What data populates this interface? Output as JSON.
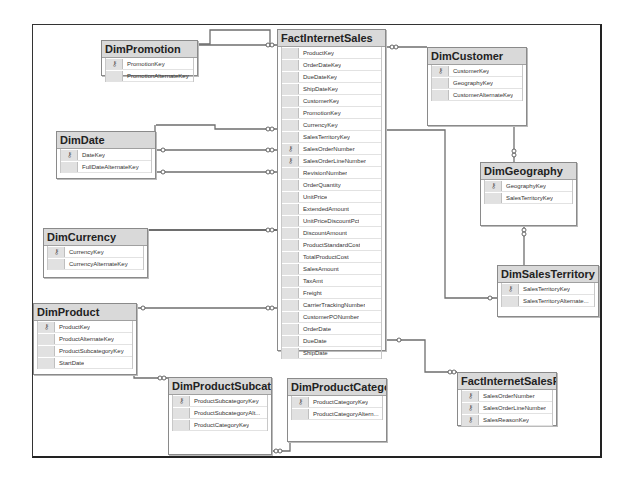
{
  "diagram": {
    "tables": [
      {
        "id": "fact_internet_sales",
        "title": "FactInternetSales",
        "x": 277,
        "y": 29,
        "w": 109,
        "h": 322,
        "columns": [
          {
            "name": "ProductKey",
            "pk": false
          },
          {
            "name": "OrderDateKey",
            "pk": false
          },
          {
            "name": "DueDateKey",
            "pk": false
          },
          {
            "name": "ShipDateKey",
            "pk": false
          },
          {
            "name": "CustomerKey",
            "pk": false
          },
          {
            "name": "PromotionKey",
            "pk": false
          },
          {
            "name": "CurrencyKey",
            "pk": false
          },
          {
            "name": "SalesTerritoryKey",
            "pk": false
          },
          {
            "name": "SalesOrderNumber",
            "pk": true
          },
          {
            "name": "SalesOrderLineNumber",
            "pk": true
          },
          {
            "name": "RevisionNumber",
            "pk": false
          },
          {
            "name": "OrderQuantity",
            "pk": false
          },
          {
            "name": "UnitPrice",
            "pk": false
          },
          {
            "name": "ExtendedAmount",
            "pk": false
          },
          {
            "name": "UnitPriceDiscountPct",
            "pk": false
          },
          {
            "name": "DiscountAmount",
            "pk": false
          },
          {
            "name": "ProductStandardCost",
            "pk": false
          },
          {
            "name": "TotalProductCost",
            "pk": false
          },
          {
            "name": "SalesAmount",
            "pk": false
          },
          {
            "name": "TaxAmt",
            "pk": false
          },
          {
            "name": "Freight",
            "pk": false
          },
          {
            "name": "CarrierTrackingNumber",
            "pk": false
          },
          {
            "name": "CustomerPONumber",
            "pk": false
          },
          {
            "name": "OrderDate",
            "pk": false
          },
          {
            "name": "DueDate",
            "pk": false
          },
          {
            "name": "ShipDate",
            "pk": false
          }
        ]
      },
      {
        "id": "dim_promotion",
        "title": "DimPromotion",
        "x": 101,
        "y": 40,
        "w": 97,
        "h": 36,
        "columns": [
          {
            "name": "PromotionKey",
            "pk": true
          },
          {
            "name": "PromotionAlternateKey",
            "pk": false
          }
        ]
      },
      {
        "id": "dim_customer",
        "title": "DimCustomer",
        "x": 427,
        "y": 47,
        "w": 100,
        "h": 79,
        "columns": [
          {
            "name": "CustomerKey",
            "pk": true
          },
          {
            "name": "GeographyKey",
            "pk": false
          },
          {
            "name": "CustomerAlternateKey",
            "pk": false
          }
        ]
      },
      {
        "id": "dim_date",
        "title": "DimDate",
        "x": 56,
        "y": 131,
        "w": 100,
        "h": 48,
        "columns": [
          {
            "name": "DateKey",
            "pk": true
          },
          {
            "name": "FullDateAlternateKey",
            "pk": false
          }
        ]
      },
      {
        "id": "dim_geography",
        "title": "DimGeography",
        "x": 480,
        "y": 162,
        "w": 97,
        "h": 64,
        "columns": [
          {
            "name": "GeographyKey",
            "pk": true
          },
          {
            "name": "SalesTerritoryKey",
            "pk": false
          }
        ]
      },
      {
        "id": "dim_currency",
        "title": "DimCurrency",
        "x": 43,
        "y": 228,
        "w": 105,
        "h": 50,
        "columns": [
          {
            "name": "CurrencyKey",
            "pk": true
          },
          {
            "name": "CurrencyAlternateKey",
            "pk": false
          }
        ]
      },
      {
        "id": "dim_sales_territory",
        "title": "DimSalesTerritory",
        "x": 497,
        "y": 265,
        "w": 102,
        "h": 52,
        "columns": [
          {
            "name": "SalesTerritoryKey",
            "pk": true
          },
          {
            "name": "SalesTerritoryAlternate...",
            "pk": false
          }
        ]
      },
      {
        "id": "dim_product",
        "title": "DimProduct",
        "x": 33,
        "y": 303,
        "w": 104,
        "h": 72,
        "columns": [
          {
            "name": "ProductKey",
            "pk": true
          },
          {
            "name": "ProductAlternateKey",
            "pk": false
          },
          {
            "name": "ProductSubcategoryKey",
            "pk": false
          },
          {
            "name": "StartDate",
            "pk": false
          }
        ]
      },
      {
        "id": "dim_product_subcategory",
        "title": "DimProductSubcatego",
        "x": 168,
        "y": 377,
        "w": 104,
        "h": 78,
        "columns": [
          {
            "name": "ProductSubcategoryKey",
            "pk": true
          },
          {
            "name": "ProductSubcategoryAlt...",
            "pk": false
          },
          {
            "name": "ProductCategoryKey",
            "pk": false
          }
        ]
      },
      {
        "id": "dim_product_category",
        "title": "DimProductCategory",
        "x": 287,
        "y": 378,
        "w": 100,
        "h": 64,
        "columns": [
          {
            "name": "ProductCategoryKey",
            "pk": true
          },
          {
            "name": "ProductCategoryAltern...",
            "pk": false
          }
        ]
      },
      {
        "id": "fact_internet_sales_reason",
        "title": "FactInternetSalesRea",
        "x": 457,
        "y": 372,
        "w": 100,
        "h": 54,
        "columns": [
          {
            "name": "SalesOrderNumber",
            "pk": true
          },
          {
            "name": "SalesOrderLineNumber",
            "pk": true
          },
          {
            "name": "SalesReasonKey",
            "pk": true
          }
        ]
      }
    ],
    "relationships": [
      {
        "from": "dim_promotion",
        "to": "fact_internet_sales"
      },
      {
        "from": "dim_customer",
        "to": "fact_internet_sales"
      },
      {
        "from": "dim_date",
        "to": "fact_internet_sales",
        "note": "OrderDateKey"
      },
      {
        "from": "dim_date",
        "to": "fact_internet_sales",
        "note": "DueDateKey"
      },
      {
        "from": "dim_date",
        "to": "fact_internet_sales",
        "note": "ShipDateKey"
      },
      {
        "from": "dim_geography",
        "to": "dim_customer"
      },
      {
        "from": "dim_sales_territory",
        "to": "dim_geography"
      },
      {
        "from": "dim_sales_territory",
        "to": "fact_internet_sales"
      },
      {
        "from": "dim_currency",
        "to": "fact_internet_sales"
      },
      {
        "from": "dim_product",
        "to": "fact_internet_sales"
      },
      {
        "from": "dim_product_subcategory",
        "to": "dim_product"
      },
      {
        "from": "dim_product_category",
        "to": "dim_product_subcategory"
      },
      {
        "from": "fact_internet_sales",
        "to": "fact_internet_sales_reason"
      }
    ],
    "pk_glyph": "⚷"
  }
}
